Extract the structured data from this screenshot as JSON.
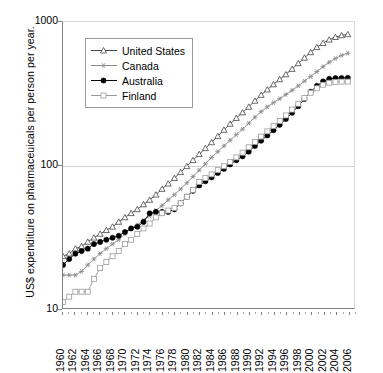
{
  "chart_data": {
    "type": "line",
    "title": "",
    "subtitle": "",
    "xlabel": "",
    "ylabel": "US$ expenditure on  pharmaceuicals per person per year.",
    "yscale": "log",
    "ylim": [
      10,
      1000
    ],
    "ytick_labels": [
      "1000",
      "100",
      "10"
    ],
    "ytick_values": [
      1000,
      100,
      10
    ],
    "xlim": [
      1960,
      2007
    ],
    "xtick_labels": [
      "1960",
      "1962",
      "1964",
      "1966",
      "1968",
      "1970",
      "1972",
      "1974",
      "1976",
      "1978",
      "1980",
      "1982",
      "1984",
      "1986",
      "1988",
      "1990",
      "1992",
      "1994",
      "1996",
      "1998",
      "2000",
      "2002",
      "2004",
      "2006"
    ],
    "grid": "horizontal-at-100",
    "legend_position": "top-left-inside",
    "x": [
      1960,
      1961,
      1962,
      1963,
      1964,
      1965,
      1966,
      1967,
      1968,
      1969,
      1970,
      1971,
      1972,
      1973,
      1974,
      1975,
      1976,
      1977,
      1978,
      1979,
      1980,
      1981,
      1982,
      1983,
      1984,
      1985,
      1986,
      1987,
      1988,
      1989,
      1990,
      1991,
      1992,
      1993,
      1994,
      1995,
      1996,
      1997,
      1998,
      1999,
      2000,
      2001,
      2002,
      2003,
      2004,
      2005,
      2006
    ],
    "series": [
      {
        "name": "United States",
        "marker": "open-triangle",
        "color": "#444444",
        "values": [
          23,
          24,
          26,
          27,
          29,
          31,
          33,
          35,
          37,
          40,
          43,
          46,
          49,
          53,
          57,
          62,
          68,
          74,
          81,
          89,
          98,
          108,
          119,
          131,
          144,
          159,
          176,
          194,
          213,
          233,
          255,
          281,
          309,
          337,
          366,
          397,
          430,
          469,
          514,
          562,
          614,
          666,
          712,
          752,
          784,
          806,
          820
        ]
      },
      {
        "name": "Canada",
        "marker": "asterisk",
        "color": "#8a8a8a",
        "values": [
          17,
          17,
          17,
          18,
          20,
          22,
          24,
          26,
          28,
          30,
          33,
          36,
          38,
          41,
          44,
          48,
          52,
          57,
          62,
          68,
          75,
          83,
          92,
          102,
          113,
          124,
          136,
          149,
          163,
          178,
          196,
          216,
          236,
          255,
          273,
          291,
          311,
          333,
          358,
          386,
          416,
          450,
          487,
          523,
          556,
          584,
          605
        ]
      },
      {
        "name": "Australia",
        "marker": "filled-circle",
        "color": "#000000",
        "values": [
          20,
          22,
          24,
          25,
          26,
          28,
          29,
          30,
          31,
          32,
          34,
          36,
          37,
          40,
          46,
          47,
          47,
          47,
          49,
          54,
          60,
          66,
          72,
          77,
          82,
          88,
          94,
          101,
          108,
          115,
          124,
          136,
          148,
          161,
          175,
          191,
          210,
          232,
          258,
          290,
          325,
          358,
          384,
          400,
          405,
          406,
          407
        ]
      },
      {
        "name": "Finland",
        "marker": "open-square",
        "color": "#9a9a9a",
        "values": [
          11,
          12,
          13,
          13,
          13,
          16,
          19,
          21,
          23,
          25,
          28,
          30,
          33,
          36,
          39,
          43,
          46,
          48,
          50,
          54,
          60,
          67,
          76,
          81,
          86,
          92,
          98,
          105,
          113,
          122,
          133,
          145,
          158,
          172,
          187,
          203,
          222,
          244,
          268,
          294,
          320,
          344,
          364,
          376,
          381,
          383,
          383
        ]
      }
    ]
  },
  "legend": {
    "items": [
      {
        "label": "United States"
      },
      {
        "label": "Canada"
      },
      {
        "label": "Australia"
      },
      {
        "label": "Finland"
      }
    ]
  }
}
